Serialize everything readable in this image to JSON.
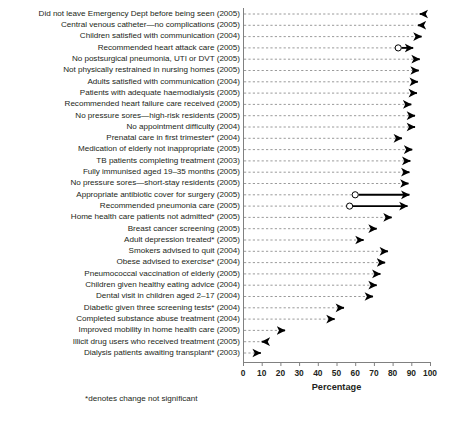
{
  "chart_data": {
    "type": "bar",
    "subtype": "arrow-change-plot",
    "title": "",
    "xlabel": "Percentage",
    "ylabel": "",
    "xlim": [
      0,
      100
    ],
    "xticks": [
      0,
      10,
      20,
      30,
      40,
      50,
      60,
      70,
      80,
      90,
      100
    ],
    "grid": true,
    "grid_style": "dashed-horizontal",
    "legend": "none",
    "annotations": [
      "*denotes change not significant"
    ],
    "marker_note": "open circle = start value, filled arrowhead = end value",
    "categories": [
      "Did not leave Emergency Dept before being seen (2005)",
      "Central venous catheter—no complications (2005)",
      "Children satisfied with communication (2004)",
      "Recommended heart attack care (2005)",
      "No postsurgical pneumonia, UTI or DVT (2005)",
      "Not physically restrained in nursing homes (2005)",
      "Adults satisfied with communication (2004)",
      "Patients with adequate haemodialysis (2005)",
      "Recommended heart failure care received (2005)",
      "No pressure sores—high-risk residents (2005)",
      "No appointment difficulty (2004)",
      "Prenatal care in first trimester* (2004)",
      "Medication of elderly not inappropriate (2005)",
      "TB patients completing treatment (2003)",
      "Fully immunised aged 19–35 months (2005)",
      "No pressure sores—short-stay residents (2005)",
      "Appropriate antibiotic cover for surgery (2005)",
      "Recommended pneumonia care (2005)",
      "Home health care patients not admitted* (2005)",
      "Breast cancer screening (2005)",
      "Adult depression treated* (2005)",
      "Smokers advised to quit (2004)",
      "Obese advised to exercise* (2004)",
      "Pneumococcal vaccination of elderly (2005)",
      "Children given healthy eating advice (2004)",
      "Dental visit in children aged 2–17 (2004)",
      "Diabetic given three screening tests* (2004)",
      "Completed substance abuse treatment (2004)",
      "Improved mobility in home health care (2005)",
      "Illicit drug users who received treatment (2005)",
      "Dialysis patients awaiting transplant* (2003)"
    ],
    "series": [
      {
        "name": "start",
        "values": [
          96.5,
          95.5,
          94.0,
          83.0,
          93.0,
          92.5,
          92.0,
          91.5,
          88.0,
          90.5,
          90.5,
          83.5,
          89.0,
          88.0,
          87.5,
          87.0,
          60.0,
          57.0,
          78.0,
          70.0,
          63.0,
          76.0,
          74.5,
          72.0,
          70.0,
          68.0,
          52.5,
          47.5,
          21.0,
          11.5,
          8.0
        ]
      },
      {
        "name": "end",
        "values": [
          94.5,
          93.5,
          95.5,
          91.0,
          94.5,
          94.0,
          93.5,
          93.0,
          90.0,
          92.0,
          92.0,
          85.0,
          90.5,
          89.5,
          89.0,
          88.5,
          89.0,
          88.0,
          79.5,
          71.5,
          64.5,
          77.5,
          76.0,
          73.5,
          71.5,
          69.5,
          54.0,
          49.0,
          22.5,
          10.0,
          9.5
        ]
      }
    ],
    "significance": {
      "not_significant_marker": "*",
      "not_significant_categories": [
        "Prenatal care in first trimester* (2004)",
        "Home health care patients not admitted* (2005)",
        "Adult depression treated* (2005)",
        "Obese advised to exercise* (2004)",
        "Diabetic given three screening tests* (2004)",
        "Dialysis patients awaiting transplant* (2003)"
      ]
    },
    "colors": {
      "marker": "#000000",
      "grid": "#808080",
      "axis": "#808080",
      "text": "#231f20"
    }
  }
}
